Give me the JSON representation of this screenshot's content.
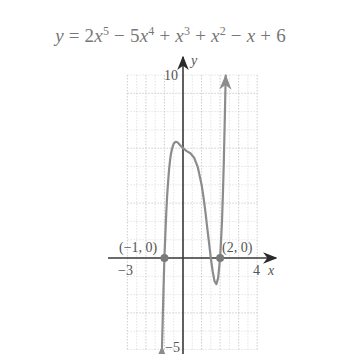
{
  "chart_data": {
    "type": "line",
    "title_parts": {
      "lhs": "y",
      "eq": " = 2",
      "t1": "x",
      "e1": "5",
      "op2": " − 5",
      "t2": "x",
      "e2": "4",
      "op3": " + ",
      "t3": "x",
      "e3": "3",
      "op4": " + ",
      "t4": "x",
      "e4": "2",
      "op5": " − ",
      "t5": "x",
      "rest": " + 6"
    },
    "xlabel": "x",
    "ylabel": "y",
    "xlim": [
      -3,
      4
    ],
    "ylim": [
      -5,
      10
    ],
    "grid": true,
    "tick_labels": {
      "x_min": "−3",
      "x_max": "4",
      "y_max": "10",
      "y_min": "−5"
    },
    "annotations": [
      {
        "label": "(−1, 0)",
        "x": -1,
        "y": 0
      },
      {
        "label": "(2, 0)",
        "x": 2,
        "y": 0
      }
    ],
    "series": [
      {
        "name": "y = 2x^5 − 5x^4 + x^3 + x^2 − x + 6",
        "color": "#8c8c8c",
        "x": [
          -1.13,
          -1.1,
          -1.05,
          -1.0,
          -0.95,
          -0.9,
          -0.85,
          -0.8,
          -0.75,
          -0.7,
          -0.65,
          -0.6,
          -0.5,
          -0.4,
          -0.3,
          -0.2,
          -0.1,
          0.0,
          0.2,
          0.4,
          0.6,
          0.8,
          1.0,
          1.1,
          1.2,
          1.3,
          1.4,
          1.5,
          1.6,
          1.7,
          1.8,
          1.9,
          2.0,
          2.05,
          2.1,
          2.15,
          2.2,
          2.25,
          2.3
        ],
        "y": [
          -4.87,
          -3.63,
          -1.71,
          0.0,
          1.36,
          2.52,
          3.46,
          4.23,
          4.85,
          5.31,
          5.67,
          5.94,
          6.25,
          6.35,
          6.32,
          6.22,
          6.11,
          6.0,
          5.84,
          5.72,
          5.48,
          4.96,
          4.0,
          3.36,
          2.58,
          1.71,
          0.85,
          0.0,
          -0.74,
          -1.26,
          -1.43,
          -1.07,
          0.0,
          0.9,
          2.01,
          3.47,
          5.23,
          7.39,
          9.96
        ]
      }
    ],
    "colors": {
      "axis": "#3a3a3a",
      "grid": "#c8c8c8",
      "curve": "#8c8c8c",
      "point": "#7a7a7a",
      "text": "#555555"
    }
  }
}
